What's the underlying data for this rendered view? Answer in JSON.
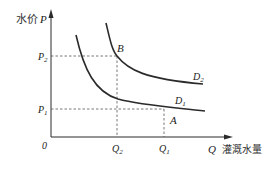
{
  "diagram": {
    "y_axis": {
      "label_cn": "水价",
      "symbol": "P"
    },
    "x_axis": {
      "label_cn": "灌溉水量",
      "symbol": "Q"
    },
    "origin": "0",
    "price_levels": [
      {
        "symbol": "P",
        "sub": "2"
      },
      {
        "symbol": "P",
        "sub": "1"
      }
    ],
    "quantity_levels": [
      {
        "symbol": "Q",
        "sub": "2"
      },
      {
        "symbol": "Q",
        "sub": "1"
      }
    ],
    "curves": [
      {
        "symbol": "D",
        "sub": "1"
      },
      {
        "symbol": "D",
        "sub": "2"
      }
    ],
    "points": {
      "A": "A",
      "B": "B"
    },
    "colors": {
      "line": "#2a2a2a",
      "dash": "#555555",
      "text": "#222222"
    }
  }
}
